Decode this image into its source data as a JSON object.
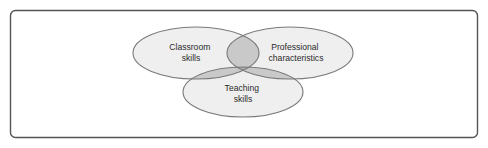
{
  "figure": {
    "name": "three-circle-venn-diagram",
    "frame": {
      "border_color": "#555555",
      "background_color": "#ffffff",
      "corner_radius": 5
    },
    "style": {
      "ellipse_fill": "#efefef",
      "ellipse_stroke": "#7a7a7a",
      "overlap_fill_pair": "#c9c9c9",
      "overlap_fill_triple": "#a9a9a9",
      "text_color": "#2b2b2b"
    },
    "sets": [
      {
        "id": "classroom-skills",
        "label_line1": "Classroom",
        "label_line2": "skills",
        "position": "left",
        "cx": 196,
        "cy": 53,
        "rx": 63,
        "ry": 26,
        "label_x": 191,
        "label_y": 48
      },
      {
        "id": "professional-characteristics",
        "label_line1": "Professional",
        "label_line2": "characteristics",
        "position": "right",
        "cx": 290,
        "cy": 53,
        "rx": 63,
        "ry": 26,
        "label_x": 296,
        "label_y": 48
      },
      {
        "id": "teaching-skills",
        "label_line1": "Teaching",
        "label_line2": "skills",
        "position": "bottom",
        "cx": 243,
        "cy": 92,
        "rx": 60,
        "ry": 25,
        "label_x": 243,
        "label_y": 89
      }
    ]
  }
}
